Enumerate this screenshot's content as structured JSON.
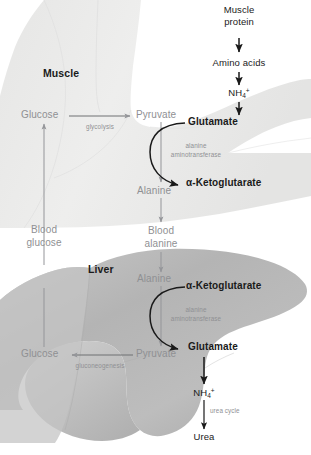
{
  "figure": {
    "type": "biochemical-pathway-diagram"
  },
  "colors": {
    "background": "#ffffff",
    "muscle_fill": "#ececeb",
    "muscle_fill_dark": "#e2e2e1",
    "liver_fill": "#b9b9b9",
    "liver_fill_dark": "#a6a6a6",
    "liver_fill_light": "#cccccc",
    "grey_text": "#8f9093",
    "black_text": "#1a1a1a",
    "grey_arrow": "#949599",
    "black_arrow": "#1a1a1a"
  },
  "muscle": {
    "organ_label": "Muscle",
    "protein_source": "Muscle\nprotein",
    "protein_line1": "Muscle",
    "protein_line2": "protein",
    "amino_acids": "Amino acids",
    "ammonium": {
      "formula": "NH",
      "subscript": "4",
      "superscript": "+"
    },
    "glucose": "Glucose",
    "glycolysis": "glycolysis",
    "pyruvate": "Pyruvate",
    "glutamate": "Glutamate",
    "enzyme_line1": "alanine",
    "enzyme_line2": "aminotransferase",
    "ketoglutarate": "α-Ketoglutarate",
    "alanine": "Alanine"
  },
  "blood": {
    "glucose_line1": "Blood",
    "glucose_line2": "glucose",
    "alanine_line1": "Blood",
    "alanine_line2": "alanine"
  },
  "liver": {
    "organ_label": "Liver",
    "alanine": "Alanine",
    "ketoglutarate": "α-Ketoglutarate",
    "enzyme_line1": "alanine",
    "enzyme_line2": "aminotransferase",
    "glutamate": "Glutamate",
    "pyruvate": "Pyruvate",
    "gluconeogenesis": "gluconeogenesis",
    "glucose": "Glucose",
    "ammonium": {
      "formula": "NH",
      "subscript": "4",
      "superscript": "+"
    },
    "urea_cycle": "urea cycle",
    "urea": "Urea"
  }
}
